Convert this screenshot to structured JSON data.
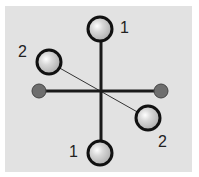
{
  "diagram": {
    "background": "#e2e2e2",
    "center": {
      "x": 101,
      "y": 92
    },
    "axes": [
      {
        "name": "vertical-axis",
        "x1": 101,
        "y1": 29,
        "x2": 101,
        "y2": 153,
        "width": 3
      },
      {
        "name": "horizontal-axis",
        "x1": 39,
        "y1": 91,
        "x2": 161,
        "y2": 91,
        "width": 3
      },
      {
        "name": "diagonal-axis",
        "x1": 49,
        "y1": 62,
        "x2": 148,
        "y2": 118,
        "width": 1
      }
    ],
    "large_balls": [
      {
        "name": "ball-top",
        "cx": 100,
        "cy": 29,
        "r": 12,
        "pair": "1"
      },
      {
        "name": "ball-bottom",
        "cx": 100,
        "cy": 153,
        "r": 12,
        "pair": "1"
      },
      {
        "name": "ball-upper-left",
        "cx": 49,
        "cy": 62,
        "r": 12,
        "pair": "2"
      },
      {
        "name": "ball-lower-right",
        "cx": 148,
        "cy": 118,
        "r": 12,
        "pair": "2"
      }
    ],
    "small_balls": [
      {
        "name": "small-ball-left",
        "cx": 39,
        "cy": 91,
        "r": 7
      },
      {
        "name": "small-ball-right",
        "cx": 161,
        "cy": 91,
        "r": 7
      }
    ],
    "labels": [
      {
        "text": "1",
        "x": 120,
        "y": 20
      },
      {
        "text": "2",
        "x": 18,
        "y": 44
      },
      {
        "text": "2",
        "x": 158,
        "y": 134
      },
      {
        "text": "1",
        "x": 69,
        "y": 144
      }
    ]
  }
}
